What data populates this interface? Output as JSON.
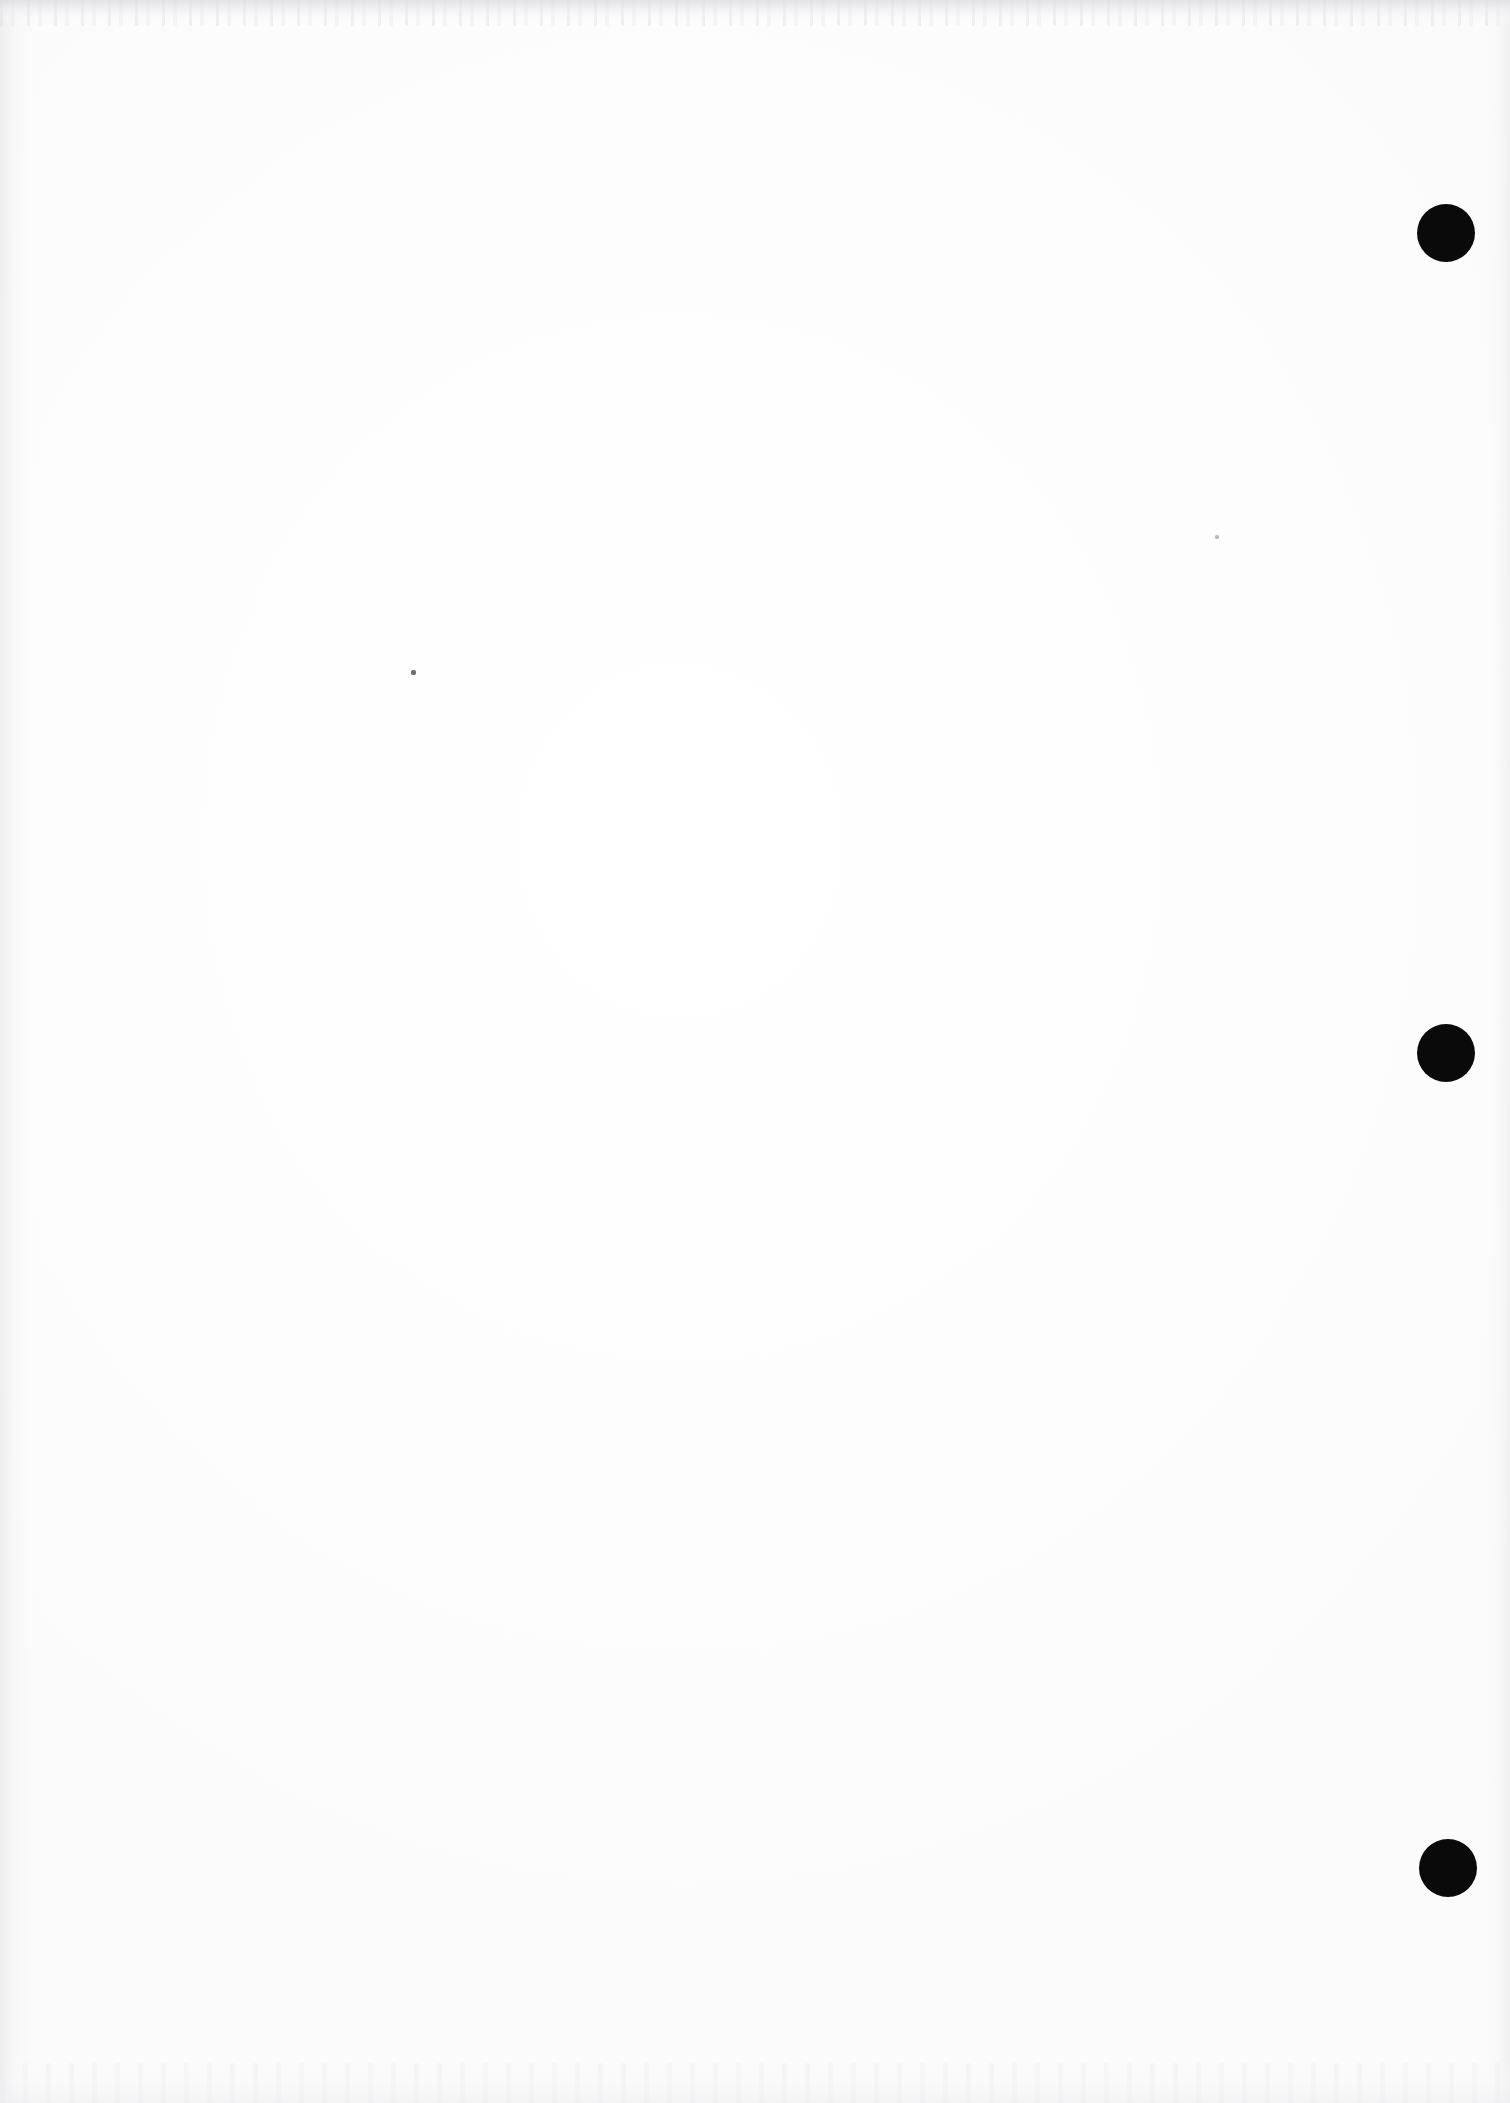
{
  "page": {
    "kind": "scanned-document-page",
    "width": 1510,
    "height": 2103,
    "paper_color": "#fdfdfd",
    "ink_color": "#0a0a0a",
    "text_content": "",
    "visible_text_blocks": []
  },
  "marks": {
    "label": "punch-marks",
    "count": 3,
    "color": "#0a0a0a",
    "items": [
      {
        "name": "punch-mark-top",
        "x": 1446,
        "y": 233,
        "diameter": 58
      },
      {
        "name": "punch-mark-middle",
        "x": 1446,
        "y": 1053,
        "diameter": 58
      },
      {
        "name": "punch-mark-bottom",
        "x": 1448,
        "y": 1868,
        "diameter": 58
      }
    ]
  },
  "specks": {
    "label": "scan-artifacts",
    "count": 2,
    "items": [
      {
        "name": "speck-left",
        "x": 413,
        "y": 672,
        "size": 5,
        "color": "#6b6b70"
      },
      {
        "name": "speck-right",
        "x": 1217,
        "y": 537,
        "size": 4,
        "color": "#b9b9bf"
      }
    ]
  },
  "artifacts": {
    "top_noise_band": "faint grey horizontal scan noise along top edge",
    "bottom_noise_band": "faint grey horizontal scan noise along bottom edge",
    "left_streak": "faint vertical grey streak along left edge",
    "right_streak": "faint vertical grey streak along right edge"
  }
}
